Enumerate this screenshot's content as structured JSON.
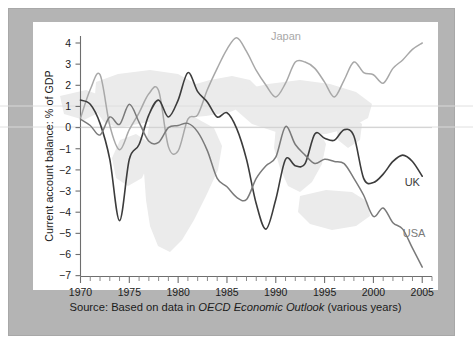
{
  "caption": {
    "prefix": "Source: Based on data in ",
    "italic": "OECD Economic Outlook",
    "suffix": " (various years)"
  },
  "colors": {
    "frame": "#b4b4b4",
    "plot_background": "#ffffff",
    "map_watermark": "#ebebeb",
    "japan": "#a8a8a8",
    "uk": "#3c3c3c",
    "usa": "#7a7a7a",
    "axis": "#6e6e6e",
    "text": "#1b1b1b"
  },
  "chart_data": {
    "type": "line",
    "title": "",
    "xlabel": "",
    "ylabel": "Current account balance: % of GDP",
    "xlim": [
      1970,
      2006
    ],
    "ylim": [
      -7,
      4.6
    ],
    "yticks": [
      4,
      3,
      2,
      1,
      0,
      -1,
      -2,
      -3,
      -4,
      -5,
      -6,
      -7
    ],
    "ytick_labels": [
      "4",
      "3",
      "2",
      "1",
      "0",
      "−1",
      "−2",
      "−3",
      "−4",
      "−5",
      "−6",
      "−7"
    ],
    "xticks": [
      1970,
      1975,
      1980,
      1985,
      1990,
      1995,
      2000,
      2005
    ],
    "xtick_labels": [
      "1970",
      "1975",
      "1980",
      "1985",
      "1990",
      "1995",
      "2000",
      "2005"
    ],
    "x_minor_tick_interval": 1,
    "grid": false,
    "zero_line": true,
    "legend": "inline-labels",
    "x": [
      1970,
      1971,
      1972,
      1973,
      1974,
      1975,
      1976,
      1977,
      1978,
      1979,
      1980,
      1981,
      1982,
      1983,
      1984,
      1985,
      1986,
      1987,
      1988,
      1989,
      1990,
      1991,
      1992,
      1993,
      1994,
      1995,
      1996,
      1997,
      1998,
      1999,
      2000,
      2001,
      2002,
      2003,
      2004,
      2005
    ],
    "series": [
      {
        "name": "Japan",
        "color": "#a8a8a8",
        "label_position": {
          "x": 1989.5,
          "y": 4.15
        },
        "values": [
          0.45,
          1.8,
          2.5,
          0.1,
          -1.05,
          -0.1,
          0.7,
          1.6,
          1.75,
          -0.9,
          -1.1,
          0.4,
          0.6,
          1.8,
          2.8,
          3.7,
          4.25,
          3.6,
          2.7,
          2.0,
          1.45,
          2.1,
          3.1,
          3.1,
          2.8,
          2.15,
          1.45,
          2.25,
          3.1,
          2.6,
          2.5,
          2.1,
          2.8,
          3.2,
          3.7,
          4.0
        ]
      },
      {
        "name": "UK",
        "color": "#3c3c3c",
        "label_position": {
          "x": 2003.2,
          "y": -2.75
        },
        "values": [
          1.3,
          1.1,
          0.2,
          -1.5,
          -4.4,
          -1.5,
          -0.8,
          0.6,
          1.3,
          0.5,
          1.3,
          2.6,
          1.7,
          1.2,
          0.5,
          0.7,
          -0.05,
          -1.5,
          -3.6,
          -4.8,
          -3.4,
          -1.5,
          -1.8,
          -1.7,
          -0.3,
          -0.5,
          -0.6,
          -0.1,
          -0.4,
          -2.4,
          -2.6,
          -2.2,
          -1.6,
          -1.3,
          -1.6,
          -2.3
        ]
      },
      {
        "name": "USA",
        "color": "#7a7a7a",
        "label_position": {
          "x": 2003.0,
          "y": -5.15
        },
        "values": [
          0.4,
          0.1,
          -0.35,
          0.5,
          0.15,
          1.1,
          0.25,
          -0.65,
          -0.7,
          0.0,
          0.1,
          0.2,
          -0.2,
          -1.1,
          -2.4,
          -2.8,
          -3.3,
          -3.4,
          -2.4,
          -1.8,
          -1.4,
          0.05,
          -0.8,
          -1.3,
          -1.7,
          -1.5,
          -1.6,
          -1.7,
          -2.4,
          -3.2,
          -4.2,
          -3.8,
          -4.5,
          -4.8,
          -5.7,
          -6.6
        ]
      }
    ]
  },
  "axis_meta": {
    "y_axis_title": "Current account balance: % of GDP"
  }
}
